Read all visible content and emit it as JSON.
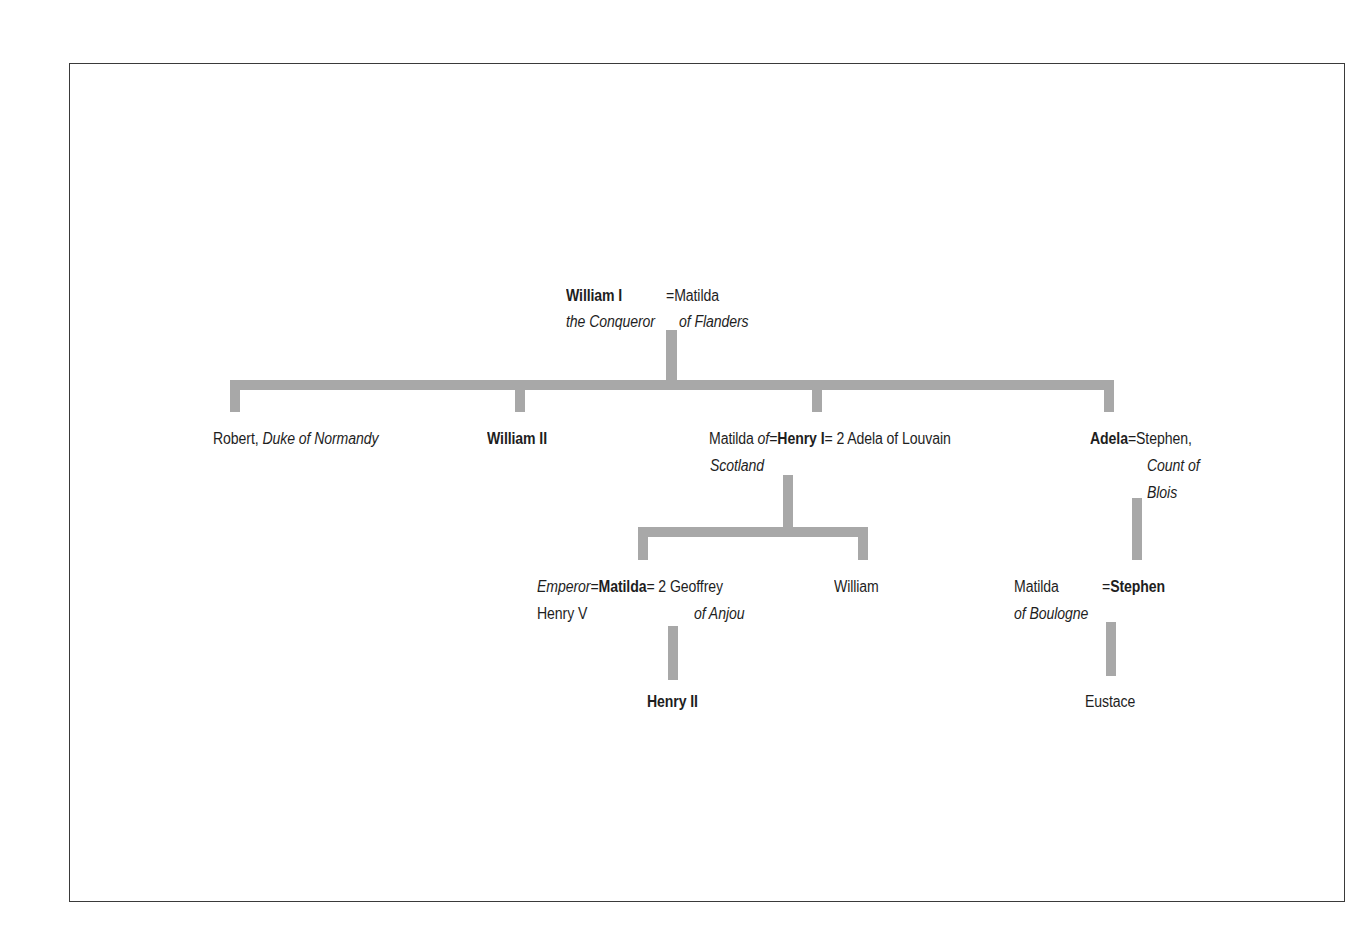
{
  "diagram": {
    "type": "family-tree",
    "line_color": "#a8a8a8",
    "frame_color": "#3a3a3a",
    "root": {
      "name": "William I",
      "epithet": "the Conqueror",
      "eq": "=",
      "spouse": "Matilda",
      "spouse_epithet": "of Flanders"
    },
    "gen2": {
      "robert": {
        "name": "Robert,",
        "title": "Duke of Normandy"
      },
      "william2": {
        "name": "William II"
      },
      "henry1": {
        "spouse1": "Matilda",
        "spouse1_of": "of",
        "eq1": "=",
        "name": "Henry I",
        "eq2": "= 2",
        "spouse2": "Adela of Louvain",
        "spouse1_place": "Scotland"
      },
      "adela": {
        "name": "Adela",
        "eq": "=",
        "spouse": "Stephen,",
        "spouse_title_1": "Count of",
        "spouse_title_2": "Blois"
      }
    },
    "gen3": {
      "matilda": {
        "spouse1": "Emperor",
        "eq1": "=",
        "name": "Matilda",
        "eq2": "= 2",
        "spouse2": "Geoffrey",
        "spouse1_line2": "Henry V",
        "spouse2_line2": "of Anjou"
      },
      "william": {
        "name": "William"
      },
      "stephen": {
        "spouse": "Matilda",
        "spouse_line2": "of Boulogne",
        "eq": "=",
        "name": "Stephen"
      }
    },
    "gen4": {
      "henry2": {
        "name": "Henry II"
      },
      "eustace": {
        "name": "Eustace"
      }
    }
  }
}
